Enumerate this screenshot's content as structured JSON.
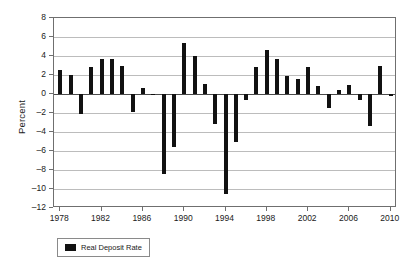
{
  "chart_data": {
    "type": "bar",
    "title": "",
    "xlabel": "",
    "ylabel": "Percent",
    "ylim": [
      -12,
      8
    ],
    "ytick_step": 2,
    "yticks": [
      "8",
      "6",
      "4",
      "2",
      "0",
      "-2",
      "-4",
      "-6",
      "-8",
      "-10",
      "-12"
    ],
    "xlim": [
      1977.4,
      2010.6
    ],
    "xticks": [
      "1978",
      "1982",
      "1986",
      "1990",
      "1994",
      "1998",
      "2002",
      "2006",
      "2010"
    ],
    "grid": true,
    "legend": {
      "position": "below-left",
      "entries": [
        {
          "name": "Real Deposit Rate",
          "color": "#111111"
        }
      ]
    },
    "series": [
      {
        "name": "Real Deposit Rate",
        "color": "#111111",
        "x": [
          1978,
          1979,
          1980,
          1981,
          1982,
          1983,
          1984,
          1985,
          1986,
          1987,
          1988,
          1989,
          1990,
          1991,
          1992,
          1993,
          1994,
          1995,
          1996,
          1997,
          1998,
          1999,
          2000,
          2001,
          2002,
          2003,
          2004,
          2005,
          2006,
          2007,
          2008,
          2009,
          2010
        ],
        "values": [
          2.5,
          2.0,
          -2.1,
          2.8,
          3.7,
          3.7,
          3.0,
          -1.9,
          0.6,
          -0.1,
          -8.4,
          -5.6,
          5.35,
          4.0,
          1.1,
          -3.2,
          -10.5,
          -5.1,
          -0.6,
          2.8,
          4.6,
          3.7,
          1.9,
          1.6,
          2.85,
          0.8,
          -1.5,
          0.4,
          1.0,
          -0.6,
          -3.35,
          3.0,
          -0.25
        ]
      }
    ],
    "axis_color": "#6f6f6f",
    "grid_color": "#bcbcbc",
    "background": "#ffffff"
  }
}
